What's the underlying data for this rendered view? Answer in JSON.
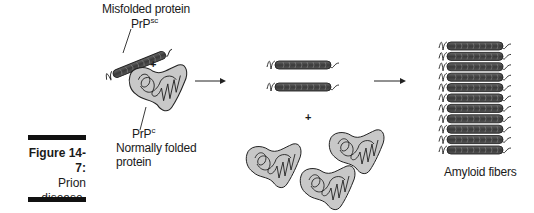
{
  "figure": {
    "number_label": "Figure 14-7:",
    "caption_line1": "Prion",
    "caption_line2": "disease."
  },
  "stage1": {
    "misfolded_label": "Misfolded protein",
    "misfolded_symbol_base": "PrP",
    "misfolded_symbol_sup": "sc",
    "plus": "+",
    "normal_symbol_base": "PrP",
    "normal_symbol_sup": "c",
    "normal_label_line1": "Normally folded",
    "normal_label_line2": "protein"
  },
  "stage2": {
    "misfolded_count": 2,
    "plus": "+",
    "normal_count": 3
  },
  "stage3": {
    "fiber_count": 11,
    "label": "Amyloid fibers"
  },
  "colors": {
    "fiber_fill": "#4a4a4a",
    "protein_fill": "#c8c8c8",
    "outline": "#222222",
    "caption_bar": "#111111"
  }
}
